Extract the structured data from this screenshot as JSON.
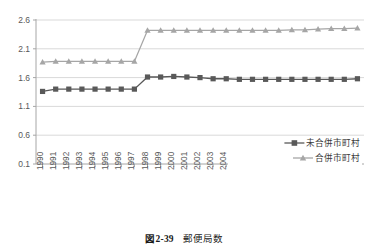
{
  "caption": {
    "figure_label": "図",
    "figure_number": "2-39",
    "title": "郵便局数"
  },
  "chart_data": {
    "type": "line",
    "title": "",
    "xlabel": "",
    "ylabel": "",
    "grid": true,
    "legend_position": "bottom-right",
    "ylim": [
      0.1,
      2.6
    ],
    "yticks": [
      0.1,
      0.6,
      1.1,
      1.6,
      2.1,
      2.6
    ],
    "ytick_labels": [
      "0.1",
      "0.6",
      "1.1",
      "1.6",
      "2.1",
      "2.6"
    ],
    "categories": [
      "1990",
      "1991",
      "1992",
      "1993",
      "1994",
      "1995",
      "1996",
      "1997",
      "1998",
      "1999",
      "2000",
      "2001",
      "2002",
      "2003",
      "2004",
      "2005",
      "2006",
      "2007",
      "2008",
      "2009",
      "2010",
      "2011",
      "2012",
      "2013",
      "2014"
    ],
    "series": [
      {
        "name": "未合併市町村",
        "color": "#595959",
        "marker": "square",
        "values": [
          1.36,
          1.4,
          1.4,
          1.4,
          1.4,
          1.4,
          1.4,
          1.4,
          1.61,
          1.61,
          1.62,
          1.61,
          1.6,
          1.58,
          1.58,
          1.57,
          1.57,
          1.57,
          1.57,
          1.57,
          1.57,
          1.57,
          1.57,
          1.57,
          1.58
        ]
      },
      {
        "name": "合併市町村",
        "color": "#a6a6a6",
        "marker": "triangle",
        "values": [
          1.87,
          1.88,
          1.88,
          1.88,
          1.88,
          1.88,
          1.88,
          1.88,
          2.42,
          2.42,
          2.42,
          2.42,
          2.42,
          2.42,
          2.42,
          2.42,
          2.42,
          2.42,
          2.42,
          2.43,
          2.43,
          2.44,
          2.45,
          2.45,
          2.46
        ]
      }
    ]
  }
}
